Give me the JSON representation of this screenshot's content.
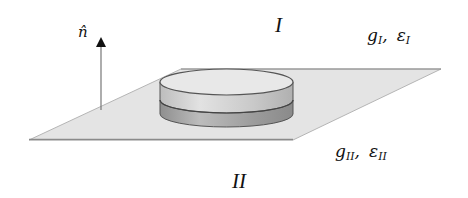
{
  "diagram": {
    "normal_vector": {
      "label": "n̂"
    },
    "regions": [
      {
        "id": "I",
        "label": "I",
        "g": "g",
        "g_sub": "I",
        "eps": "ε",
        "eps_sub": "I"
      },
      {
        "id": "II",
        "label": "II",
        "g": "g",
        "g_sub": "II",
        "eps": "ε",
        "eps_sub": "II"
      }
    ],
    "separator": ",",
    "colors": {
      "plane_fill": "#e4e4e4",
      "plane_edge": "#8a8a8a",
      "cylinder_top": "#e8e8e8",
      "cylinder_upper_band": "#c8c8c8",
      "cylinder_lower_band": "#9a9a9a",
      "outline": "#444444",
      "arrow": "#111111"
    }
  }
}
